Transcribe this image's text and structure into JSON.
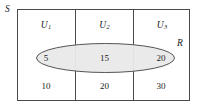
{
  "diagram": {
    "type": "venn-partition-diagram",
    "sample_space_label": "S",
    "event_label": "R",
    "colors": {
      "stroke": "#4a4a4a",
      "ellipse_fill": "#e9e9e9",
      "ellipse_stroke": "#555555",
      "text": "#1b1b1b",
      "background": "#ffffff"
    },
    "partitions": [
      {
        "name": "U",
        "subscript": "1",
        "inside_event_count": "5",
        "outside_event_count": "10"
      },
      {
        "name": "U",
        "subscript": "2",
        "inside_event_count": "15",
        "outside_event_count": "20"
      },
      {
        "name": "U",
        "subscript": "3",
        "inside_event_count": "20",
        "outside_event_count": "30"
      }
    ]
  }
}
